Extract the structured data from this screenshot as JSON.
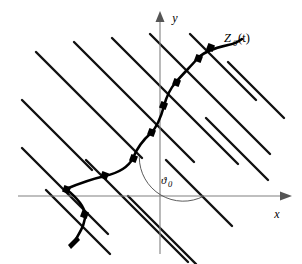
{
  "figure": {
    "background_color": "#ffffff",
    "width": 302,
    "height": 264
  },
  "axes": {
    "x_label": "x",
    "y_label": "y",
    "axis_color": "#808080",
    "origin": {
      "x": 160,
      "y": 196
    },
    "x_axis": {
      "x1": 18,
      "y1": 196,
      "x2": 284,
      "y2": 196
    },
    "y_axis": {
      "x1": 160,
      "y1": 252,
      "x2": 160,
      "y2": 16
    }
  },
  "angle": {
    "label": "ϑ",
    "subscript": "0",
    "value_text": "ϑ0",
    "arc_center": {
      "x": 160,
      "y": 196
    },
    "arc_radius": 44,
    "start_deg": 0,
    "end_deg": 118,
    "arc_color": "#4a4a4a"
  },
  "curve": {
    "label": "Z",
    "label_subscript": "0",
    "label_arg": "(t)",
    "label_full": "Z0(t)",
    "color": "#000000",
    "stroke_width": 2.6,
    "label_position": {
      "x": 224,
      "y": 42
    },
    "points": [
      {
        "x": 74,
        "y": 243
      },
      {
        "x": 78,
        "y": 232
      },
      {
        "x": 84,
        "y": 218
      },
      {
        "x": 84,
        "y": 208
      },
      {
        "x": 80,
        "y": 200
      },
      {
        "x": 72,
        "y": 193
      },
      {
        "x": 66,
        "y": 189
      },
      {
        "x": 74,
        "y": 185
      },
      {
        "x": 88,
        "y": 180
      },
      {
        "x": 104,
        "y": 176
      },
      {
        "x": 118,
        "y": 172
      },
      {
        "x": 128,
        "y": 166
      },
      {
        "x": 133,
        "y": 158
      },
      {
        "x": 136,
        "y": 150
      },
      {
        "x": 142,
        "y": 142
      },
      {
        "x": 150,
        "y": 135
      },
      {
        "x": 156,
        "y": 126
      },
      {
        "x": 160,
        "y": 116
      },
      {
        "x": 163,
        "y": 106
      },
      {
        "x": 166,
        "y": 98
      },
      {
        "x": 170,
        "y": 90
      },
      {
        "x": 176,
        "y": 82
      },
      {
        "x": 183,
        "y": 75
      },
      {
        "x": 190,
        "y": 68
      },
      {
        "x": 196,
        "y": 61
      },
      {
        "x": 202,
        "y": 55
      },
      {
        "x": 210,
        "y": 50
      },
      {
        "x": 220,
        "y": 47
      },
      {
        "x": 232,
        "y": 44
      },
      {
        "x": 240,
        "y": 40
      }
    ],
    "tail_arrow": {
      "x": 74,
      "y": 243,
      "angle_deg": 250
    }
  },
  "nodes": {
    "shape": "square",
    "size": 6,
    "color": "#000000",
    "positions": [
      {
        "x": 84,
        "y": 218
      },
      {
        "x": 66,
        "y": 189
      },
      {
        "x": 104,
        "y": 176
      },
      {
        "x": 133,
        "y": 158
      },
      {
        "x": 156,
        "y": 126
      },
      {
        "x": 166,
        "y": 98
      },
      {
        "x": 183,
        "y": 75
      },
      {
        "x": 210,
        "y": 50
      }
    ]
  },
  "lattice": {
    "description": "Family of parallel lines at -45 degrees",
    "color": "#111111",
    "stroke_width": 2.4,
    "angle_deg": -45,
    "count": 9,
    "lines": [
      {
        "x1": 22,
        "y1": 100,
        "x2": 92,
        "y2": 170
      },
      {
        "x1": 22,
        "y1": 148,
        "x2": 108,
        "y2": 234
      },
      {
        "x1": 36,
        "y1": 52,
        "x2": 142,
        "y2": 158
      },
      {
        "x1": 46,
        "y1": 190,
        "x2": 110,
        "y2": 254
      },
      {
        "x1": 74,
        "y1": 42,
        "x2": 194,
        "y2": 162
      },
      {
        "x1": 112,
        "y1": 38,
        "x2": 238,
        "y2": 164
      },
      {
        "x1": 86,
        "y1": 160,
        "x2": 188,
        "y2": 262
      },
      {
        "x1": 150,
        "y1": 34,
        "x2": 270,
        "y2": 154
      },
      {
        "x1": 190,
        "y1": 34,
        "x2": 256,
        "y2": 100
      }
    ]
  },
  "colors": {
    "ink": "#000000",
    "lattice": "#111111",
    "axis": "#808080",
    "arc": "#4a4a4a",
    "background": "#ffffff"
  }
}
